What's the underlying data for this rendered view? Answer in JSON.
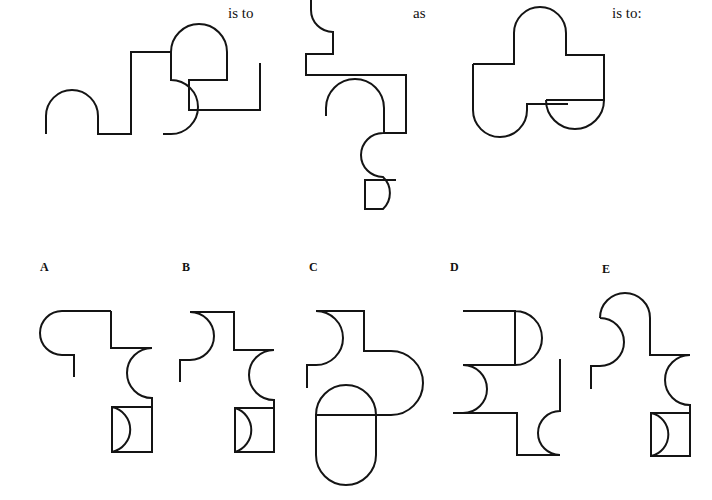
{
  "page": {
    "kind": "visual-analogy-puzzle",
    "background_color": "#ffffff",
    "ink_color": "#141414",
    "stroke_width": 2,
    "width": 712,
    "height": 500
  },
  "connectors": {
    "is_to_1": "is to",
    "as": "as",
    "is_to_2": "is to:"
  },
  "prompt_figures": [
    {
      "id": "prompt-1",
      "name": "prompt-figure-1",
      "description": "Irregular outline with a bump arc on the lower left, a tall rectangular step, a large dome arc on top and a hook arc biting inward on the right, ending in a squared-off notch.",
      "path": "M 46 134 L 46 116 A 26 26 0 0 1 98 116 L 98 134 L 131 134 L 131 52 L 171 52 A 28 28 0 0 1 227 52 L 227 80 L 189 80 L 189 110 L 260 110 L 260 63 M 171 52 L 171 80 A 27 27 0 0 1 171 134 L 163 134"
    },
    {
      "id": "prompt-2",
      "name": "prompt-figure-2",
      "description": "Tall figure: a cut-off arc at the top edge, a stepped shoulder, a long horizontal top bar, a bump arc protruding up into the body, an S-curve of two arcs, and a squared hook at the bottom.",
      "path": "M 311 0 L 311 10 A 22 22 0 0 0 333 32 L 333 54 L 306 54 L 306 75 L 406 75 L 406 133 L 383 133 M 326 116 L 326 108 A 29 29 0 0 1 384 108 L 384 133 M 383 133 A 22 22 0 0 0 383 177 A 22 22 0 0 1 383 209 L 365 209 L 365 180 L 396 180 M 365 209 L 365 208"
    },
    {
      "id": "prompt-3",
      "name": "prompt-figure-3",
      "description": "Blocky outline with a dome on top, a stepped right shoulder, a half-disc cut into the right side, and a rounded U-shaped foot at the bottom left with a small tab.",
      "path": "M 473 64 L 514 64 L 514 33 A 26 26 0 0 1 566 33 L 566 55 L 604 55 L 604 100 L 546 100 M 604 100 L 604 68 M 546 100 A 29 29 0 0 0 604 100 M 473 64 L 473 110 A 27 27 0 0 0 527 110 L 527 104 L 568 104"
    }
  ],
  "options": [
    {
      "letter": "A",
      "id": "option-a",
      "name": "answer-option-a",
      "description": "Rounded top-left corner arc with a small inward notch, a stepped right side, an inward hook arc on the right, and a rectangle at the bottom containing a half-disc.",
      "path": "M 111 311 L 62 311 A 22 22 0 0 0 62 355 L 74 355 L 74 377 M 111 311 L 111 348 L 152 348 A 25 25 0 0 0 152 398 L 152 407 L 112 407 L 112 452 L 152 452 L 152 407 M 112 407 A 23 23 0 0 1 112 452"
    },
    {
      "letter": "B",
      "id": "option-b",
      "name": "answer-option-b",
      "description": "Square top-left corner with an arc biting inward, a stepped right side, an inward hook arc, and a bottom rectangle containing a half-disc.",
      "path": "M 190 312 L 234 312 L 234 350 L 274 350 A 25 25 0 0 0 274 400 L 274 408 L 235 408 L 235 452 L 274 452 L 274 408 M 235 408 A 23 23 0 0 1 235 452 M 190 312 A 24 24 0 0 1 190 360 L 180 360 L 180 382"
    },
    {
      "letter": "C",
      "id": "option-c",
      "name": "answer-option-c",
      "description": "Larger figure: square top-left with an inward arc, stepped right side, a large bulging arc protruding right, and a deep rounded U foot containing a half-disc.",
      "path": "M 316 311 L 364 311 L 364 351 L 391 351 A 32 32 0 0 1 391 415 L 376 415 L 376 455 A 30 30 0 0 1 316 455 L 316 415 L 376 415 M 316 415 A 27 27 0 0 1 376 415 M 316 311 A 27 27 0 0 1 316 365 L 307 365 L 307 388"
    },
    {
      "letter": "D",
      "id": "option-d",
      "name": "answer-option-d",
      "description": "Rectangle at top containing a half-disc, an arc bulging into the left side, a stepped base, and a separate hook arc on the lower right attached to a vertical line.",
      "path": "M 463 311 L 515 311 L 515 365 L 463 365 M 515 311 A 26 26 0 0 1 515 365 M 463 365 A 24 24 0 0 1 463 413 L 453 413 L 453 413 M 463 413 L 453 413 M 453 413 L 517 413 L 517 455 L 560 455 M 560 455 A 22 22 0 0 1 560 411 L 560 359"
    },
    {
      "letter": "E",
      "id": "option-e",
      "name": "answer-option-e",
      "description": "Domed top-left with an arc biting inward below it, a stepped right side, an inward hook arc, and a bottom rectangle containing a half-disc.",
      "path": "M 600 318 A 25 25 0 0 1 650 318 L 650 355 L 690 355 A 25 25 0 0 0 690 405 L 690 413 L 651 413 L 651 456 L 690 456 L 690 413 M 651 413 A 22 22 0 0 1 651 456 M 600 318 A 24 24 0 0 1 600 366 L 591 366 L 591 389"
    }
  ]
}
